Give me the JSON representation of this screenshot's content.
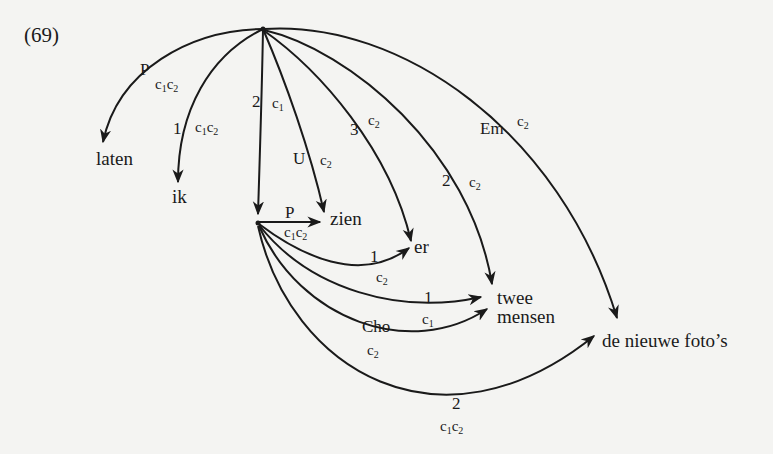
{
  "example_number": "(69)",
  "nodes": {
    "laten": "laten",
    "ik": "ik",
    "zien": "zien",
    "er": "er",
    "twee": "twee",
    "mensen": "mensen",
    "foto": "de nieuwe foto’s"
  },
  "edges": [
    {
      "id": "top-laten",
      "from": "top",
      "to": "laten",
      "label": "P",
      "ann": "c1c2",
      "ann_parts": [
        "c",
        "1",
        "c",
        "2"
      ]
    },
    {
      "id": "top-ik",
      "from": "top",
      "to": "ik",
      "label": "1",
      "ann": "c1c2",
      "ann_parts": [
        "c",
        "1",
        "c",
        "2"
      ]
    },
    {
      "id": "top-lower",
      "from": "top",
      "to": "lower-hub",
      "label": "2",
      "ann": "c1",
      "ann_parts": [
        "c",
        "1"
      ]
    },
    {
      "id": "top-zien",
      "from": "top",
      "to": "zien",
      "label": "U",
      "ann": "c2",
      "ann_parts": [
        "c",
        "2"
      ]
    },
    {
      "id": "top-er",
      "from": "top",
      "to": "er",
      "label": "3",
      "ann": "c2",
      "ann_parts": [
        "c",
        "2"
      ]
    },
    {
      "id": "top-twee",
      "from": "top",
      "to": "twee mensen",
      "label": "2",
      "ann": "c2",
      "ann_parts": [
        "c",
        "2"
      ]
    },
    {
      "id": "top-foto",
      "from": "top",
      "to": "de nieuwe foto’s",
      "label": "Em",
      "ann": "c2",
      "ann_parts": [
        "c",
        "2"
      ]
    },
    {
      "id": "lower-zien",
      "from": "lower-hub",
      "to": "zien",
      "label": "P",
      "ann": "c1c2",
      "ann_parts": [
        "c",
        "1",
        "c",
        "2"
      ]
    },
    {
      "id": "lower-er",
      "from": "lower-hub",
      "to": "er",
      "label": "1",
      "ann": "c2",
      "ann_parts": [
        "c",
        "2"
      ]
    },
    {
      "id": "lower-twee",
      "from": "lower-hub",
      "to": "twee mensen",
      "label": "1",
      "ann": "c1",
      "ann_parts": [
        "c",
        "1"
      ]
    },
    {
      "id": "lower-mensen",
      "from": "lower-hub",
      "to": "twee mensen",
      "label": "Cho",
      "ann": "c2",
      "ann_parts": [
        "c",
        "2"
      ]
    },
    {
      "id": "lower-foto",
      "from": "lower-hub",
      "to": "de nieuwe foto’s",
      "label": "2",
      "ann": "c1c2",
      "ann_parts": [
        "c",
        "1",
        "c",
        "2"
      ]
    }
  ],
  "colors": {
    "ink": "#1a1a1a",
    "paper": "#f4f4f2"
  }
}
